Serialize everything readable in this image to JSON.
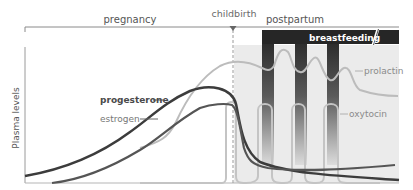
{
  "diagram": {
    "y_axis_label": "Plasma levels",
    "phases": {
      "pregnancy": "pregnancy",
      "childbirth": "childbirth",
      "postpartum": "postpartum"
    },
    "breastfeeding_label": "breastfeeding",
    "hormones": {
      "progesterone": "progesterone",
      "estrogen": "estrogen",
      "prolactin": "prolactin",
      "oxytocin": "oxytocin"
    },
    "colors": {
      "progesterone": "#3a3a3a",
      "estrogen": "#555555",
      "prolactin": "#b8b8b8",
      "oxytocin": "#bdbdbd",
      "postpartum_shade": "#ebebeb",
      "breastfeeding_bar": "#262626",
      "axis": "#8a8a8a",
      "text": "#555555"
    },
    "breastfeeding_sessions": 3
  }
}
